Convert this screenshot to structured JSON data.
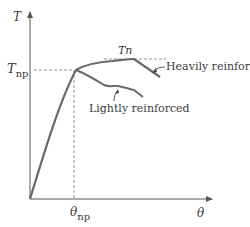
{
  "diagram": {
    "type": "torque-twist curve",
    "y_axis": {
      "label": "T"
    },
    "x_axis": {
      "label": "θ"
    },
    "y_marker": {
      "symbol": "T",
      "subscript": "np"
    },
    "x_marker": {
      "symbol": "θ",
      "subscript": "np"
    },
    "peak_label": "Tn",
    "curves": [
      {
        "name": "Heavily reinforced",
        "label": "Heavily reinforced"
      },
      {
        "name": "Lightly reinforced",
        "label": "Lightly reinforced"
      }
    ],
    "colors": {
      "curve": "#666666",
      "axis": "#555555",
      "dashed": "#888888",
      "text": "#3a3a3a"
    }
  }
}
